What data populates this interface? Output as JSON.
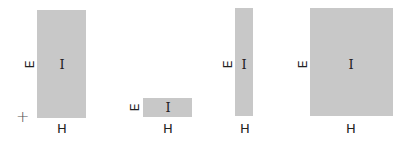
{
  "diagram": {
    "fill_color": "#c8c8c8",
    "shapes": [
      {
        "id": "rect-1",
        "center_label": "I",
        "side_label": "E",
        "bottom_label": "H"
      },
      {
        "id": "rect-2",
        "center_label": "I",
        "side_label": "E",
        "bottom_label": "H"
      },
      {
        "id": "rect-3",
        "center_label": "I",
        "side_label": "E",
        "bottom_label": "H"
      },
      {
        "id": "rect-4",
        "center_label": "I",
        "side_label": "E",
        "bottom_label": "H"
      }
    ],
    "origin_marker": "+"
  }
}
